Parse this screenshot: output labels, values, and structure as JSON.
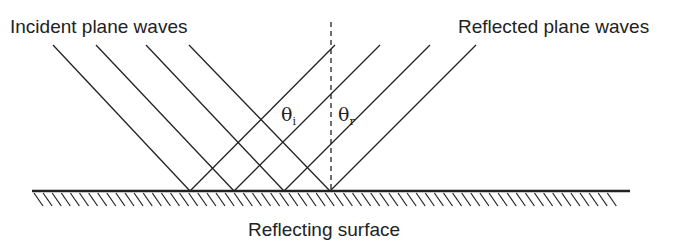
{
  "labels": {
    "incident": "Incident plane waves",
    "reflected": "Reflected plane waves",
    "surface": "Reflecting surface",
    "theta_i_symbol": "θ",
    "theta_i_sub": "i",
    "theta_r_symbol": "θ",
    "theta_r_sub": "r"
  },
  "colors": {
    "line": "#222222",
    "background": "#ffffff"
  },
  "geometry": {
    "surface_y": 191,
    "surface_x_start": 32,
    "surface_x_end": 630,
    "normal_x": 331,
    "incident_rays": [
      {
        "x1": 53,
        "y1": 45,
        "x2": 190,
        "y2": 191
      },
      {
        "x1": 96,
        "y1": 45,
        "x2": 234,
        "y2": 191
      },
      {
        "x1": 146,
        "y1": 45,
        "x2": 284,
        "y2": 191
      },
      {
        "x1": 189,
        "y1": 45,
        "x2": 330,
        "y2": 191
      }
    ],
    "reflected_rays": [
      {
        "x1": 190,
        "y1": 191,
        "x2": 335,
        "y2": 45
      },
      {
        "x1": 234,
        "y1": 191,
        "x2": 380,
        "y2": 45
      },
      {
        "x1": 284,
        "y1": 191,
        "x2": 430,
        "y2": 45
      },
      {
        "x1": 330,
        "y1": 191,
        "x2": 476,
        "y2": 45
      }
    ]
  }
}
